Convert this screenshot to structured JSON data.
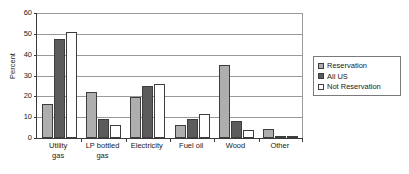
{
  "chart_data": {
    "type": "bar",
    "title": "",
    "xlabel": "",
    "ylabel": "Percent",
    "ylim": [
      0,
      60
    ],
    "yticks": [
      60,
      50,
      40,
      30,
      20,
      10,
      0
    ],
    "grid": true,
    "legend_position": "right",
    "categories": [
      "Utility gas",
      "LP bottled gas",
      "Electricity",
      "Fuel oil",
      "Wood",
      "Other"
    ],
    "category_lines": [
      [
        "Utility",
        "gas"
      ],
      [
        "LP bottled",
        "gas"
      ],
      [
        "Electricity",
        ""
      ],
      [
        "Fuel oil",
        ""
      ],
      [
        "Wood",
        ""
      ],
      [
        "Other",
        ""
      ]
    ],
    "series": [
      {
        "name": "Reservation",
        "color": "#aeaeae",
        "values": [
          16.3,
          22.2,
          19.7,
          6.2,
          35.0,
          4.1
        ]
      },
      {
        "name": "All US",
        "color": "#5c5c5c",
        "values": [
          47.7,
          9.1,
          25.0,
          9.2,
          8.4,
          1.0
        ]
      },
      {
        "name": "Not Reservation",
        "color": "#ffffff",
        "values": [
          51.0,
          6.3,
          26.0,
          11.4,
          4.0,
          1.1
        ]
      }
    ]
  },
  "legend": {
    "items": [
      {
        "label": "Reservation",
        "color": "#aeaeae"
      },
      {
        "label": "All US",
        "color": "#5c5c5c"
      },
      {
        "label": "Not Reservation",
        "color": "#ffffff"
      }
    ]
  },
  "axes": {
    "y_label": "Percent"
  }
}
